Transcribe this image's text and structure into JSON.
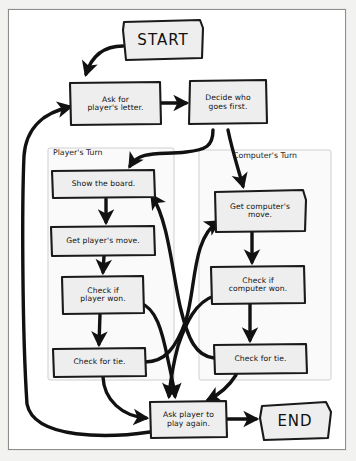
{
  "diagram": {
    "colors": {
      "page_background": "#f2f2f0",
      "paper": "#ffffff",
      "node_fill": "#eeeeee",
      "node_stroke": "#1a1a1a",
      "arrow": "#111111",
      "panel_stroke": "#c9c9c9",
      "panel_fill": "#fafafa"
    },
    "panels": [
      {
        "id": "player-turn",
        "label": "Player's Turn"
      },
      {
        "id": "computer-turn",
        "label": "Computer's Turn"
      }
    ],
    "nodes": [
      {
        "id": "start",
        "label": "START",
        "shape": "terminator"
      },
      {
        "id": "ask-letter",
        "label": "Ask for\nplayer's letter.",
        "shape": "process"
      },
      {
        "id": "decide-first",
        "label": "Decide who\ngoes first.",
        "shape": "process"
      },
      {
        "id": "show-board",
        "label": "Show the board.",
        "shape": "process"
      },
      {
        "id": "player-move",
        "label": "Get player's move.",
        "shape": "process"
      },
      {
        "id": "player-won",
        "label": "Check if\nplayer won.",
        "shape": "process"
      },
      {
        "id": "player-tie",
        "label": "Check for tie.",
        "shape": "process"
      },
      {
        "id": "comp-move",
        "label": "Get computer's\nmove.",
        "shape": "process"
      },
      {
        "id": "comp-won",
        "label": "Check if\ncomputer won.",
        "shape": "process"
      },
      {
        "id": "comp-tie",
        "label": "Check for tie.",
        "shape": "process"
      },
      {
        "id": "play-again",
        "label": "Ask player to\nplay again.",
        "shape": "process"
      },
      {
        "id": "end",
        "label": "END",
        "shape": "terminator"
      }
    ],
    "edges": [
      {
        "from": "start",
        "to": "ask-letter"
      },
      {
        "from": "ask-letter",
        "to": "decide-first"
      },
      {
        "from": "decide-first",
        "to": "show-board"
      },
      {
        "from": "decide-first",
        "to": "comp-move"
      },
      {
        "from": "show-board",
        "to": "player-move"
      },
      {
        "from": "player-move",
        "to": "player-won"
      },
      {
        "from": "player-won",
        "to": "player-tie"
      },
      {
        "from": "player-won",
        "to": "play-again"
      },
      {
        "from": "player-tie",
        "to": "comp-move"
      },
      {
        "from": "player-tie",
        "to": "play-again"
      },
      {
        "from": "comp-move",
        "to": "comp-won"
      },
      {
        "from": "comp-won",
        "to": "comp-tie"
      },
      {
        "from": "comp-won",
        "to": "play-again"
      },
      {
        "from": "comp-tie",
        "to": "show-board"
      },
      {
        "from": "comp-tie",
        "to": "play-again"
      },
      {
        "from": "play-again",
        "to": "end"
      },
      {
        "from": "play-again",
        "to": "ask-letter"
      }
    ]
  }
}
